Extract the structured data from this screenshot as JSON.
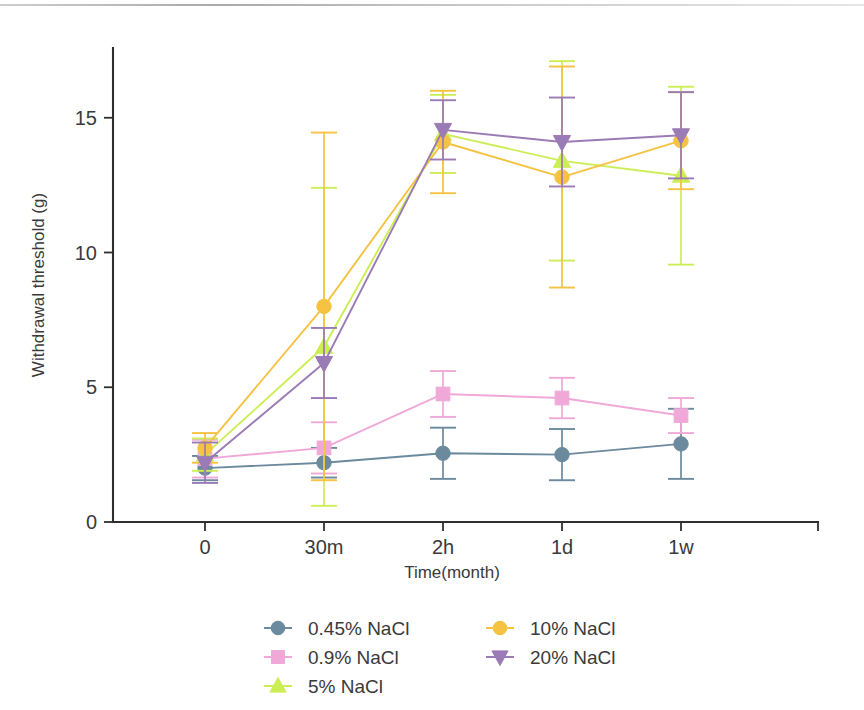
{
  "figure": {
    "background": "#ffffff",
    "has_scan_artifact": true
  },
  "chart_data": {
    "type": "line",
    "title": "",
    "xlabel": "Time(month)",
    "ylabel": "Withdrawal threshold (g)",
    "categories": [
      "0",
      "30m",
      "2h",
      "1d",
      "1w"
    ],
    "xtick_labels": [
      "0",
      "30m",
      "2h",
      "1d",
      "1w"
    ],
    "ytick_labels": [
      "0",
      "5",
      "10",
      "15"
    ],
    "ytick_values": [
      0,
      5,
      10,
      15
    ],
    "ylim": [
      0,
      17.5
    ],
    "grid": false,
    "legend_position": "bottom",
    "error_bars": "symmetric-sd",
    "series": [
      {
        "name": "0.45% NaCl",
        "color": "#6b8a9e",
        "marker": "circle",
        "values": [
          2.0,
          2.2,
          2.55,
          2.5,
          2.9
        ],
        "errors": [
          0.45,
          0.55,
          0.95,
          0.95,
          1.3
        ]
      },
      {
        "name": "0.9% NaCl",
        "color": "#f0a8d8",
        "marker": "square",
        "values": [
          2.35,
          2.75,
          4.75,
          4.6,
          3.95
        ],
        "errors": [
          0.7,
          0.95,
          0.85,
          0.75,
          0.65
        ]
      },
      {
        "name": "5% NaCl",
        "color": "#ccee55",
        "marker": "triangle-up",
        "values": [
          2.5,
          6.5,
          14.4,
          13.4,
          12.85
        ],
        "errors": [
          0.6,
          5.9,
          1.45,
          3.7,
          3.3
        ]
      },
      {
        "name": "10% NaCl",
        "color": "#f5c242",
        "marker": "circle",
        "values": [
          2.75,
          8.0,
          14.1,
          12.8,
          14.15
        ],
        "errors": [
          0.55,
          6.45,
          1.9,
          4.1,
          1.8
        ]
      },
      {
        "name": "20% NaCl",
        "color": "#9b7bb5",
        "marker": "triangle-down",
        "values": [
          2.2,
          5.9,
          14.55,
          14.1,
          14.35
        ],
        "errors": [
          0.75,
          1.3,
          1.1,
          1.65,
          1.6
        ]
      }
    ]
  },
  "legend": {
    "entries": [
      {
        "label": "0.45% NaCl",
        "color": "#6b8a9e",
        "marker": "circle"
      },
      {
        "label": "0.9% NaCl",
        "color": "#f0a8d8",
        "marker": "square"
      },
      {
        "label": "5% NaCl",
        "color": "#ccee55",
        "marker": "triangle-up"
      },
      {
        "label": "10% NaCl",
        "color": "#f5c242",
        "marker": "circle"
      },
      {
        "label": "20% NaCl",
        "color": "#9b7bb5",
        "marker": "triangle-down"
      }
    ],
    "columns": 2,
    "column_order": [
      [
        0,
        1,
        2
      ],
      [
        3,
        4
      ]
    ]
  }
}
